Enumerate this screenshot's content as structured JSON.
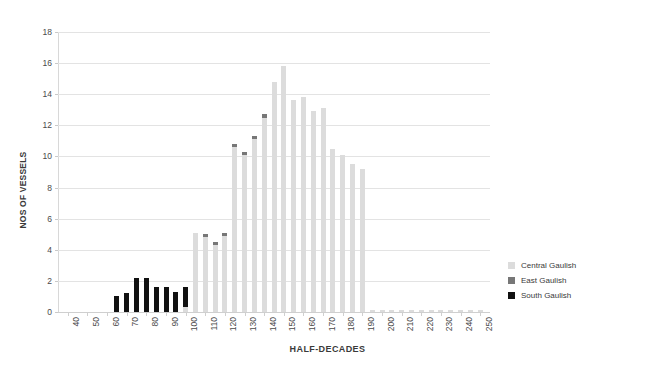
{
  "chart_data": {
    "type": "bar",
    "title": "",
    "xlabel": "HALF-DECADES",
    "ylabel": "NOS OF VESSELS",
    "ylim": [
      0,
      18
    ],
    "ytick_step": 2,
    "yticks": [
      0,
      2,
      4,
      6,
      8,
      10,
      12,
      14,
      16,
      18
    ],
    "grid": true,
    "stacked": true,
    "legend_position": "right",
    "xlim": [
      35,
      255
    ],
    "xtick_labels": [
      "40",
      "50",
      "60",
      "70",
      "80",
      "90",
      "100",
      "110",
      "120",
      "130",
      "140",
      "150",
      "160",
      "170",
      "180",
      "190",
      "200",
      "210",
      "220",
      "230",
      "240",
      "250"
    ],
    "x": [
      40,
      45,
      50,
      55,
      60,
      65,
      70,
      75,
      80,
      85,
      90,
      95,
      100,
      105,
      110,
      115,
      120,
      125,
      130,
      135,
      140,
      145,
      150,
      155,
      160,
      165,
      170,
      175,
      180,
      185,
      190,
      195,
      200,
      205,
      210,
      215,
      220,
      225,
      230,
      235,
      240,
      245,
      250
    ],
    "series": [
      {
        "name": "Central Gaulish",
        "color": "#dcdcdc",
        "values": [
          0,
          0,
          0,
          0,
          0,
          0,
          0,
          0,
          0,
          0,
          0,
          0,
          0.3,
          5.1,
          4.8,
          4.3,
          4.9,
          10.6,
          10.1,
          11.1,
          12.5,
          14.8,
          15.8,
          13.6,
          13.8,
          12.9,
          13.1,
          10.5,
          10.1,
          9.5,
          9.2,
          0.15,
          0.15,
          0.15,
          0.15,
          0.15,
          0.15,
          0.15,
          0.15,
          0.1,
          0.1,
          0.1,
          0.1
        ]
      },
      {
        "name": "East Gaulish",
        "color": "#777777",
        "values": [
          0,
          0,
          0,
          0,
          0,
          0,
          0,
          0,
          0,
          0,
          0,
          0,
          0,
          0,
          0.2,
          0.2,
          0.2,
          0.2,
          0.2,
          0.2,
          0.2,
          0,
          0,
          0,
          0,
          0,
          0,
          0,
          0,
          0,
          0,
          0,
          0,
          0,
          0,
          0,
          0,
          0,
          0,
          0,
          0,
          0,
          0
        ]
      },
      {
        "name": "South Gaulish",
        "color": "#111111",
        "values": [
          0,
          0,
          0,
          0,
          0,
          1.0,
          1.2,
          2.2,
          2.2,
          1.6,
          1.6,
          1.3,
          1.3,
          0,
          0,
          0,
          0,
          0,
          0,
          0,
          0,
          0,
          0,
          0,
          0,
          0,
          0,
          0,
          0,
          0,
          0,
          0,
          0,
          0,
          0,
          0,
          0,
          0,
          0,
          0,
          0,
          0,
          0
        ]
      }
    ]
  },
  "legend": {
    "items": [
      {
        "label": "Central Gaulish",
        "color": "#dcdcdc"
      },
      {
        "label": "East Gaulish",
        "color": "#777777"
      },
      {
        "label": "South Gaulish",
        "color": "#111111"
      }
    ]
  }
}
